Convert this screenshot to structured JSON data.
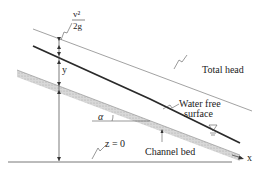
{
  "diagram": {
    "type": "open-channel-flow-energy-diagram",
    "labels": {
      "velocity_head_numerator": "v²",
      "velocity_head_denominator": "2g",
      "depth": "y",
      "total_head": "Total head",
      "water_surface_line1": "Water free",
      "water_surface_line2": "surface",
      "angle": "α",
      "datum": "z = 0",
      "channel_bed": "Channel bed",
      "x_axis": "x"
    },
    "colors": {
      "total_head_line": "#8a8a8a",
      "water_surface_line": "#2a2a2a",
      "channel_bed_fill": "#cfcfcf",
      "datum_line": "#555555",
      "text": "#222222"
    }
  }
}
